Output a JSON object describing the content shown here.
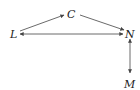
{
  "diagram": {
    "nodes": [
      {
        "id": "L",
        "label": "L",
        "x": 14,
        "y": 34
      },
      {
        "id": "C",
        "label": "C",
        "x": 72,
        "y": 14
      },
      {
        "id": "N",
        "label": "N",
        "x": 130,
        "y": 33
      },
      {
        "id": "M",
        "label": "M",
        "x": 130,
        "y": 80
      }
    ],
    "edges": [
      {
        "from": "L",
        "to": "C",
        "direction": "forward"
      },
      {
        "from": "C",
        "to": "N",
        "direction": "forward"
      },
      {
        "from": "L",
        "to": "N",
        "direction": "both"
      },
      {
        "from": "N",
        "to": "M",
        "direction": "both"
      }
    ],
    "colors": {
      "line": "#444444",
      "text": "#222222",
      "background": "#ffffff"
    }
  }
}
